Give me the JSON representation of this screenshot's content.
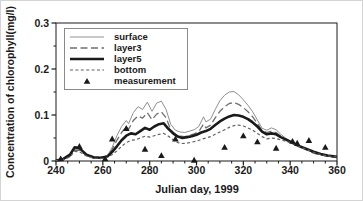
{
  "chart_data": {
    "type": "line",
    "title": "",
    "xlabel": "Julian day, 1999",
    "ylabel": "Concentration of chlorophyll(mg/l)",
    "xlim": [
      240,
      360
    ],
    "ylim": [
      0,
      0.3
    ],
    "x_ticks": [
      "240",
      "260",
      "280",
      "300",
      "320",
      "340",
      "360"
    ],
    "y_ticks": [
      "0",
      "0.1",
      "0.2",
      "0.3"
    ],
    "x_minor_tick_step": 5,
    "y_minor_tick_step": 0.05,
    "grid": false,
    "legend_position": "upper-left",
    "colors": {
      "frame": "#1a1a1a",
      "text": "#1a1a1a",
      "surface_line": "#909090",
      "layer3_line": "#707070",
      "layer5_line": "#1a1a1a",
      "bottom_line": "#606060",
      "marker": "#1a1a1a"
    },
    "series": [
      {
        "name": "surface",
        "style": "thin-solid",
        "color": "#909090",
        "points": [
          [
            240,
            0.001
          ],
          [
            243,
            0.003
          ],
          [
            246,
            0.012
          ],
          [
            248,
            0.027
          ],
          [
            250,
            0.026
          ],
          [
            253,
            0.013
          ],
          [
            256,
            0.007
          ],
          [
            259,
            0.007
          ],
          [
            262,
            0.012
          ],
          [
            264,
            0.03
          ],
          [
            266,
            0.055
          ],
          [
            268,
            0.075
          ],
          [
            270,
            0.088
          ],
          [
            271,
            0.081
          ],
          [
            273,
            0.105
          ],
          [
            275,
            0.118
          ],
          [
            277,
            0.112
          ],
          [
            279,
            0.128
          ],
          [
            281,
            0.108
          ],
          [
            283,
            0.126
          ],
          [
            285,
            0.13
          ],
          [
            287,
            0.112
          ],
          [
            289,
            0.08
          ],
          [
            291,
            0.067
          ],
          [
            293,
            0.063
          ],
          [
            295,
            0.062
          ],
          [
            297,
            0.065
          ],
          [
            299,
            0.068
          ],
          [
            301,
            0.075
          ],
          [
            303,
            0.096
          ],
          [
            304,
            0.085
          ],
          [
            306,
            0.091
          ],
          [
            308,
            0.112
          ],
          [
            310,
            0.131
          ],
          [
            312,
            0.143
          ],
          [
            314,
            0.15
          ],
          [
            316,
            0.151
          ],
          [
            318,
            0.144
          ],
          [
            320,
            0.133
          ],
          [
            322,
            0.121
          ],
          [
            324,
            0.107
          ],
          [
            326,
            0.089
          ],
          [
            328,
            0.071
          ],
          [
            330,
            0.067
          ],
          [
            332,
            0.072
          ],
          [
            334,
            0.068
          ],
          [
            336,
            0.058
          ],
          [
            338,
            0.05
          ],
          [
            340,
            0.044
          ],
          [
            342,
            0.038
          ],
          [
            344,
            0.032
          ],
          [
            347,
            0.025
          ],
          [
            350,
            0.018
          ],
          [
            353,
            0.014
          ],
          [
            356,
            0.011
          ],
          [
            360,
            0.008
          ]
        ]
      },
      {
        "name": "layer3",
        "style": "long-dash",
        "color": "#707070",
        "points": [
          [
            240,
            0.001
          ],
          [
            243,
            0.003
          ],
          [
            246,
            0.01
          ],
          [
            248,
            0.024
          ],
          [
            250,
            0.023
          ],
          [
            253,
            0.012
          ],
          [
            256,
            0.006
          ],
          [
            259,
            0.006
          ],
          [
            262,
            0.01
          ],
          [
            264,
            0.025
          ],
          [
            266,
            0.045
          ],
          [
            268,
            0.062
          ],
          [
            270,
            0.075
          ],
          [
            271,
            0.069
          ],
          [
            273,
            0.088
          ],
          [
            275,
            0.098
          ],
          [
            277,
            0.093
          ],
          [
            279,
            0.105
          ],
          [
            281,
            0.09
          ],
          [
            283,
            0.102
          ],
          [
            285,
            0.107
          ],
          [
            287,
            0.094
          ],
          [
            289,
            0.068
          ],
          [
            291,
            0.058
          ],
          [
            293,
            0.054
          ],
          [
            295,
            0.053
          ],
          [
            297,
            0.056
          ],
          [
            299,
            0.059
          ],
          [
            301,
            0.064
          ],
          [
            303,
            0.08
          ],
          [
            304,
            0.072
          ],
          [
            306,
            0.078
          ],
          [
            308,
            0.094
          ],
          [
            310,
            0.108
          ],
          [
            312,
            0.118
          ],
          [
            314,
            0.125
          ],
          [
            316,
            0.127
          ],
          [
            318,
            0.123
          ],
          [
            320,
            0.116
          ],
          [
            322,
            0.107
          ],
          [
            324,
            0.096
          ],
          [
            326,
            0.082
          ],
          [
            328,
            0.066
          ],
          [
            330,
            0.062
          ],
          [
            332,
            0.065
          ],
          [
            334,
            0.062
          ],
          [
            336,
            0.054
          ],
          [
            338,
            0.047
          ],
          [
            340,
            0.042
          ],
          [
            342,
            0.036
          ],
          [
            344,
            0.031
          ],
          [
            347,
            0.024
          ],
          [
            350,
            0.017
          ],
          [
            353,
            0.013
          ],
          [
            356,
            0.01
          ],
          [
            360,
            0.008
          ]
        ]
      },
      {
        "name": "layer5",
        "style": "thick-solid",
        "color": "#1a1a1a",
        "points": [
          [
            240,
            0.001
          ],
          [
            243,
            0.004
          ],
          [
            246,
            0.014
          ],
          [
            248,
            0.03
          ],
          [
            250,
            0.028
          ],
          [
            253,
            0.014
          ],
          [
            256,
            0.008
          ],
          [
            259,
            0.007
          ],
          [
            262,
            0.01
          ],
          [
            264,
            0.02
          ],
          [
            266,
            0.032
          ],
          [
            268,
            0.045
          ],
          [
            270,
            0.055
          ],
          [
            272,
            0.06
          ],
          [
            274,
            0.058
          ],
          [
            276,
            0.065
          ],
          [
            278,
            0.072
          ],
          [
            280,
            0.068
          ],
          [
            282,
            0.075
          ],
          [
            284,
            0.08
          ],
          [
            286,
            0.082
          ],
          [
            288,
            0.07
          ],
          [
            290,
            0.06
          ],
          [
            292,
            0.053
          ],
          [
            294,
            0.05
          ],
          [
            296,
            0.052
          ],
          [
            298,
            0.054
          ],
          [
            300,
            0.057
          ],
          [
            302,
            0.062
          ],
          [
            304,
            0.065
          ],
          [
            306,
            0.07
          ],
          [
            308,
            0.078
          ],
          [
            310,
            0.086
          ],
          [
            312,
            0.092
          ],
          [
            314,
            0.097
          ],
          [
            316,
            0.1
          ],
          [
            318,
            0.099
          ],
          [
            320,
            0.096
          ],
          [
            322,
            0.091
          ],
          [
            324,
            0.084
          ],
          [
            326,
            0.075
          ],
          [
            328,
            0.064
          ],
          [
            330,
            0.058
          ],
          [
            332,
            0.06
          ],
          [
            334,
            0.058
          ],
          [
            336,
            0.052
          ],
          [
            338,
            0.047
          ],
          [
            340,
            0.042
          ],
          [
            342,
            0.037
          ],
          [
            344,
            0.032
          ],
          [
            347,
            0.026
          ],
          [
            350,
            0.02
          ],
          [
            353,
            0.015
          ],
          [
            356,
            0.012
          ],
          [
            360,
            0.009
          ]
        ]
      },
      {
        "name": "bottom",
        "style": "short-dash",
        "color": "#606060",
        "points": [
          [
            240,
            0.001
          ],
          [
            243,
            0.003
          ],
          [
            246,
            0.009
          ],
          [
            248,
            0.021
          ],
          [
            250,
            0.02
          ],
          [
            253,
            0.011
          ],
          [
            256,
            0.006
          ],
          [
            259,
            0.005
          ],
          [
            262,
            0.008
          ],
          [
            264,
            0.014
          ],
          [
            266,
            0.022
          ],
          [
            268,
            0.032
          ],
          [
            270,
            0.04
          ],
          [
            272,
            0.045
          ],
          [
            274,
            0.046
          ],
          [
            276,
            0.05
          ],
          [
            278,
            0.054
          ],
          [
            280,
            0.052
          ],
          [
            282,
            0.055
          ],
          [
            284,
            0.058
          ],
          [
            286,
            0.06
          ],
          [
            288,
            0.054
          ],
          [
            290,
            0.046
          ],
          [
            292,
            0.04
          ],
          [
            294,
            0.038
          ],
          [
            296,
            0.039
          ],
          [
            298,
            0.041
          ],
          [
            300,
            0.043
          ],
          [
            302,
            0.047
          ],
          [
            304,
            0.05
          ],
          [
            306,
            0.053
          ],
          [
            308,
            0.058
          ],
          [
            310,
            0.063
          ],
          [
            312,
            0.068
          ],
          [
            314,
            0.073
          ],
          [
            316,
            0.077
          ],
          [
            318,
            0.078
          ],
          [
            320,
            0.076
          ],
          [
            322,
            0.072
          ],
          [
            324,
            0.067
          ],
          [
            326,
            0.06
          ],
          [
            328,
            0.053
          ],
          [
            330,
            0.048
          ],
          [
            332,
            0.05
          ],
          [
            334,
            0.049
          ],
          [
            336,
            0.046
          ],
          [
            338,
            0.043
          ],
          [
            340,
            0.04
          ],
          [
            342,
            0.036
          ],
          [
            344,
            0.031
          ],
          [
            347,
            0.025
          ],
          [
            350,
            0.019
          ],
          [
            353,
            0.014
          ],
          [
            356,
            0.011
          ],
          [
            360,
            0.009
          ]
        ]
      },
      {
        "name": "measurement",
        "style": "triangle-scatter",
        "color": "#1a1a1a",
        "points": [
          [
            242,
            0.005
          ],
          [
            250,
            0.032
          ],
          [
            261,
            0.005
          ],
          [
            264,
            0.048
          ],
          [
            270,
            0.071
          ],
          [
            278,
            0.026
          ],
          [
            285,
            0.012
          ],
          [
            291,
            0.048
          ],
          [
            299,
            0.002
          ],
          [
            312,
            0.03
          ],
          [
            320,
            0.055
          ],
          [
            326,
            0.042
          ],
          [
            334,
            0.028
          ],
          [
            341,
            0.043
          ],
          [
            343,
            0.039
          ],
          [
            348,
            0.045
          ],
          [
            355,
            0.03
          ]
        ]
      }
    ]
  }
}
